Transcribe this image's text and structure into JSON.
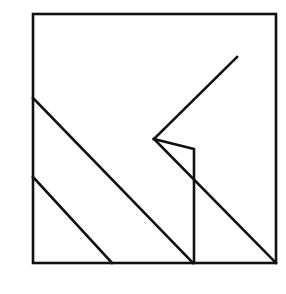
{
  "figure": {
    "type": "line-drawing",
    "stroke_color": "#111111",
    "stroke_width": 2.6,
    "frame": {
      "x": 33,
      "y": 14,
      "width": 243,
      "height": 249
    },
    "segments": [
      {
        "name": "upper-left-diagonal",
        "x1": 33,
        "y1": 98,
        "x2": 193,
        "y2": 263
      },
      {
        "name": "lower-left-diagonal",
        "x1": 33,
        "y1": 177,
        "x2": 112,
        "y2": 263
      },
      {
        "name": "arrow-upper-arm",
        "x1": 154,
        "y1": 139,
        "x2": 237,
        "y2": 57
      },
      {
        "name": "arrow-lower-diagonal",
        "x1": 154,
        "y1": 139,
        "x2": 276,
        "y2": 263
      }
    ],
    "polylines": [
      {
        "name": "kink-and-vertical",
        "points": "154,139 194,149 194,263"
      }
    ]
  },
  "caption": ""
}
